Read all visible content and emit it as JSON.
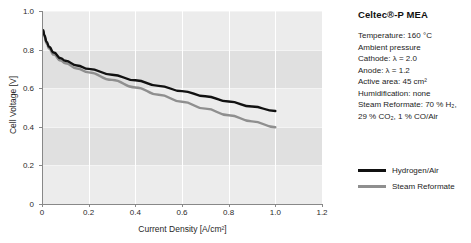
{
  "chart_data": {
    "type": "line",
    "title": "",
    "xlabel": "Current Density [A/cm²]",
    "ylabel": "Cell Voltage [V]",
    "xlim": [
      0,
      1.2
    ],
    "ylim": [
      0,
      1.0
    ],
    "xticks": [
      "0",
      "0.2",
      "0.4",
      "0.6",
      "0.8",
      "1.0",
      "1.2"
    ],
    "xtick_values": [
      0,
      0.2,
      0.4,
      0.6,
      0.8,
      1.0,
      1.2
    ],
    "yticks": [
      "0",
      "0.2",
      "0.4",
      "0.6",
      "0.8",
      "1.0"
    ],
    "ytick_values": [
      0,
      0.2,
      0.4,
      0.6,
      0.8,
      1.0
    ],
    "grid": "vertical white gridlines, alternating horizontal gray bands",
    "legend_position": "right",
    "series": [
      {
        "name": "Hydrogen/Air",
        "color": "#111111",
        "x": [
          0.005,
          0.01,
          0.02,
          0.03,
          0.05,
          0.08,
          0.1,
          0.15,
          0.2,
          0.3,
          0.4,
          0.5,
          0.6,
          0.7,
          0.8,
          0.9,
          1.0
        ],
        "y": [
          0.9,
          0.875,
          0.84,
          0.815,
          0.785,
          0.755,
          0.742,
          0.718,
          0.7,
          0.67,
          0.641,
          0.612,
          0.585,
          0.558,
          0.531,
          0.505,
          0.482
        ]
      },
      {
        "name": "Steam Reformate",
        "color": "#8f8f8f",
        "x": [
          0.005,
          0.01,
          0.02,
          0.03,
          0.05,
          0.08,
          0.1,
          0.15,
          0.2,
          0.3,
          0.4,
          0.5,
          0.6,
          0.7,
          0.8,
          0.9,
          1.0
        ],
        "y": [
          0.895,
          0.868,
          0.832,
          0.806,
          0.774,
          0.743,
          0.729,
          0.702,
          0.682,
          0.643,
          0.604,
          0.566,
          0.53,
          0.494,
          0.46,
          0.428,
          0.398
        ]
      }
    ]
  },
  "info": {
    "title": "Celtec®-P MEA",
    "lines": [
      {
        "id": "temperature",
        "text": "Temperature: 160 °C"
      },
      {
        "id": "pressure",
        "text": "Ambient pressure"
      },
      {
        "id": "cathode",
        "text": "Cathode: λ = 2.0"
      },
      {
        "id": "anode",
        "text": "Anode: λ = 1.2"
      },
      {
        "id": "active-area",
        "text": "Active area: 45 cm²"
      },
      {
        "id": "humidification",
        "text": "Humidification: none"
      },
      {
        "id": "steam-reformate-1",
        "text": "Steam Reformate: 70 % H₂,"
      },
      {
        "id": "steam-reformate-2",
        "text": "29 % CO₂, 1 % CO/Air"
      }
    ]
  },
  "legend": {
    "entries": [
      {
        "label": "Hydrogen/Air",
        "color": "#111111"
      },
      {
        "label": "Steam Reformate",
        "color": "#8f8f8f"
      }
    ]
  },
  "colors": {
    "plot_background": "#ececec",
    "band": "#e0e0e0",
    "gridline": "#ffffff",
    "axis": "#888888",
    "series_primary": "#111111",
    "series_secondary": "#8f8f8f"
  }
}
